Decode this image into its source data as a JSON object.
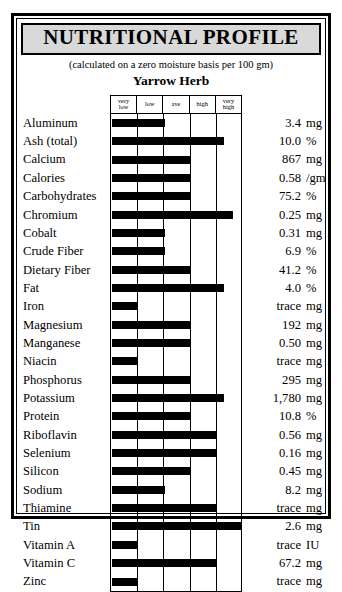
{
  "header": {
    "title": "NUTRITIONAL PROFILE",
    "subtitle": "(calculated on a zero moisture basis per 100 gm)",
    "herb_name": "Yarrow Herb"
  },
  "colors": {
    "bar": "#000000",
    "title_banner": "#d9d9d9",
    "frame": "#000000",
    "text": "#000000"
  },
  "chart_data": {
    "type": "bar",
    "title": "Yarrow Herb",
    "subtitle": "(calculated on a zero moisture basis per 100 gm)",
    "xlabel": "",
    "ylabel": "",
    "grid": true,
    "legend": "none",
    "orientation": "horizontal",
    "scale_labels": [
      "very low",
      "low",
      "ave",
      "high",
      "very high"
    ],
    "xlim": [
      0,
      5
    ],
    "categories": [
      "Aluminum",
      "Ash (total)",
      "Calcium",
      "Calories",
      "Carbohydrates",
      "Chromium",
      "Cobalt",
      "Crude Fiber",
      "Dietary Fiber",
      "Fat",
      "Iron",
      "Magnesium",
      "Manganese",
      "Niacin",
      "Phosphorus",
      "Potassium",
      "Protein",
      "Riboflavin",
      "Selenium",
      "Silicon",
      "Sodium",
      "Thiamine",
      "Tin",
      "Vitamin A",
      "Vitamin C",
      "Zinc"
    ],
    "values": [
      2.0,
      4.25,
      3.0,
      3.0,
      3.0,
      4.6,
      2.0,
      2.0,
      3.0,
      4.25,
      0.95,
      3.0,
      3.0,
      1.0,
      3.0,
      4.25,
      3.0,
      4.0,
      4.0,
      3.0,
      2.0,
      4.0,
      4.9,
      1.0,
      4.0,
      1.0
    ],
    "measurements": [
      "3.4",
      "10.0",
      "867",
      "0.58",
      "75.2",
      "0.25",
      "0.31",
      "6.9",
      "41.2",
      "4.0",
      "trace",
      "192",
      "0.50",
      "trace",
      "295",
      "1,780",
      "10.8",
      "0.56",
      "0.16",
      "0.45",
      "8.2",
      "trace",
      "2.6",
      "trace",
      "67.2",
      "trace"
    ],
    "units": [
      "mg",
      "%",
      "mg",
      "/gm",
      "%",
      "mg",
      "mg",
      "%",
      "%",
      "%",
      "mg",
      "mg",
      "mg",
      "mg",
      "mg",
      "mg",
      "%",
      "mg",
      "mg",
      "mg",
      "mg",
      "mg",
      "mg",
      "IU",
      "mg",
      "mg"
    ]
  },
  "rows": [
    {
      "name": "Aluminum",
      "bar": 2.0,
      "value": "3.4",
      "unit": "mg"
    },
    {
      "name": "Ash (total)",
      "bar": 4.25,
      "value": "10.0",
      "unit": "%"
    },
    {
      "name": "Calcium",
      "bar": 3.0,
      "value": "867",
      "unit": "mg"
    },
    {
      "name": "Calories",
      "bar": 3.0,
      "value": "0.58",
      "unit": "/gm"
    },
    {
      "name": "Carbohydrates",
      "bar": 3.0,
      "value": "75.2",
      "unit": "%"
    },
    {
      "name": "Chromium",
      "bar": 4.6,
      "value": "0.25",
      "unit": "mg"
    },
    {
      "name": "Cobalt",
      "bar": 2.0,
      "value": "0.31",
      "unit": "mg"
    },
    {
      "name": "Crude Fiber",
      "bar": 2.0,
      "value": "6.9",
      "unit": "%"
    },
    {
      "name": "Dietary Fiber",
      "bar": 3.0,
      "value": "41.2",
      "unit": "%"
    },
    {
      "name": "Fat",
      "bar": 4.25,
      "value": "4.0",
      "unit": "%"
    },
    {
      "name": "Iron",
      "bar": 0.95,
      "value": "trace",
      "unit": "mg"
    },
    {
      "name": "Magnesium",
      "bar": 3.0,
      "value": "192",
      "unit": "mg"
    },
    {
      "name": "Manganese",
      "bar": 3.0,
      "value": "0.50",
      "unit": "mg"
    },
    {
      "name": "Niacin",
      "bar": 1.0,
      "value": "trace",
      "unit": "mg"
    },
    {
      "name": "Phosphorus",
      "bar": 3.0,
      "value": "295",
      "unit": "mg"
    },
    {
      "name": "Potassium",
      "bar": 4.25,
      "value": "1,780",
      "unit": "mg"
    },
    {
      "name": "Protein",
      "bar": 3.0,
      "value": "10.8",
      "unit": "%"
    },
    {
      "name": "Riboflavin",
      "bar": 4.0,
      "value": "0.56",
      "unit": "mg"
    },
    {
      "name": "Selenium",
      "bar": 4.0,
      "value": "0.16",
      "unit": "mg"
    },
    {
      "name": "Silicon",
      "bar": 3.0,
      "value": "0.45",
      "unit": "mg"
    },
    {
      "name": "Sodium",
      "bar": 2.0,
      "value": "8.2",
      "unit": "mg"
    },
    {
      "name": "Thiamine",
      "bar": 4.0,
      "value": "trace",
      "unit": "mg"
    },
    {
      "name": "Tin",
      "bar": 4.9,
      "value": "2.6",
      "unit": "mg"
    },
    {
      "name": "Vitamin A",
      "bar": 1.0,
      "value": "trace",
      "unit": "IU"
    },
    {
      "name": "Vitamin C",
      "bar": 4.0,
      "value": "67.2",
      "unit": "mg"
    },
    {
      "name": "Zinc",
      "bar": 1.0,
      "value": "trace",
      "unit": "mg"
    }
  ],
  "columns": [
    {
      "label": "very\nlow"
    },
    {
      "label": "low"
    },
    {
      "label": "ave"
    },
    {
      "label": "high"
    },
    {
      "label": "very\nhigh"
    }
  ]
}
